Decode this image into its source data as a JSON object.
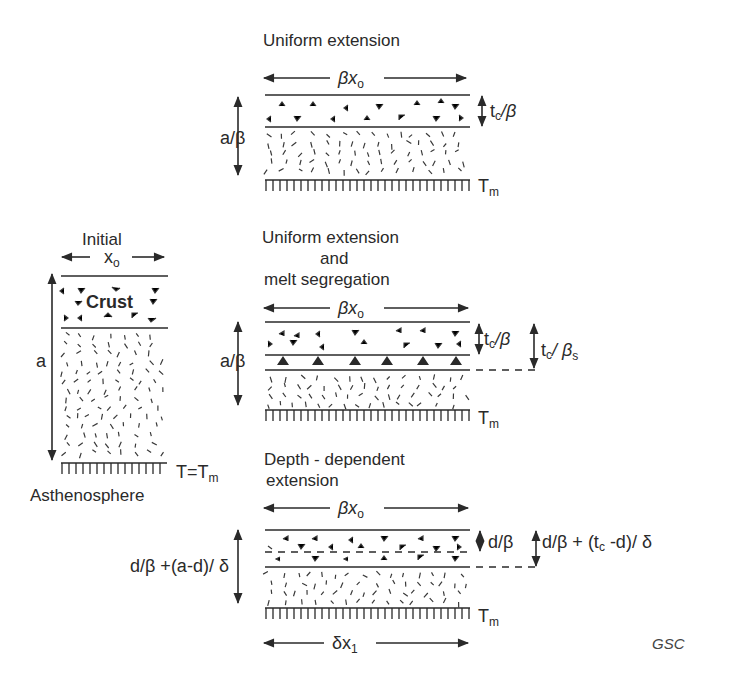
{
  "figure": {
    "credit": "GSC",
    "colors": {
      "ink": "#2a2a2a",
      "background": "#ffffff"
    }
  },
  "panels": {
    "initial": {
      "title": "Initial",
      "width_label": "x",
      "width_sub": "o",
      "crust_label": "Crust",
      "thickness_label": "a",
      "base_label": "T=T",
      "base_sub": "m",
      "below_label": "Asthenosphere"
    },
    "uniform": {
      "title": "Uniform extension",
      "width_label": "βx",
      "width_sub": "o",
      "thickness_label": "a/β",
      "crust_label_t": "t",
      "crust_label_sub": "c",
      "crust_label_rest": "/β",
      "base_label": "T",
      "base_sub": "m"
    },
    "melt": {
      "title_line1": "Uniform extension",
      "title_line2": "and",
      "title_line3": "melt segregation",
      "width_label": "βx",
      "width_sub": "o",
      "thickness_label": "a/β",
      "crust_label_t": "t",
      "crust_label_sub": "c",
      "crust_label_rest": "/β",
      "crust2_label_t": "t",
      "crust2_label_sub": "c",
      "crust2_label_rest": "/ β",
      "crust2_label_sub2": "s",
      "base_label": "T",
      "base_sub": "m"
    },
    "depth": {
      "title_line1": "Depth - dependent",
      "title_line2": "extension",
      "width_label": "βx",
      "width_sub": "o",
      "thickness_label": "d/β +(a-d)/ δ",
      "upper_label": "d/β",
      "crust_label_pre": "d/β + (t",
      "crust_label_sub": "c",
      "crust_label_post": " -d)/ δ",
      "base_label": "T",
      "base_sub": "m",
      "bottom_width_label": "δx",
      "bottom_width_sub": "1"
    }
  }
}
